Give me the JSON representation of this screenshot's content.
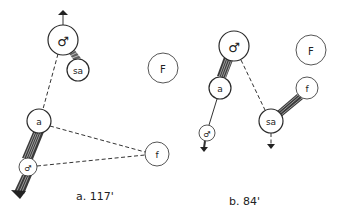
{
  "panels": [
    {
      "id": "a",
      "caption": "a. 117'",
      "nodes": {
        "male_large": {
          "label": "♂",
          "cx": 63,
          "cy": 40,
          "r": 15
        },
        "sa": {
          "label": "sa",
          "cx": 78,
          "cy": 70,
          "r": 11
        },
        "F": {
          "label": "F",
          "cx": 163,
          "cy": 68,
          "r": 15
        },
        "a": {
          "label": "a",
          "cx": 39,
          "cy": 121,
          "r": 12
        },
        "male_small": {
          "label": "♂",
          "cx": 28,
          "cy": 167,
          "r": 9
        },
        "f": {
          "label": "f",
          "cx": 157,
          "cy": 154,
          "r": 12
        }
      }
    },
    {
      "id": "b",
      "caption": "b. 84'",
      "nodes": {
        "male_large": {
          "label": "♂",
          "cx": 234,
          "cy": 46,
          "r": 15
        },
        "a": {
          "label": "a",
          "cx": 220,
          "cy": 88,
          "r": 11
        },
        "F": {
          "label": "F",
          "cx": 311,
          "cy": 50,
          "r": 15
        },
        "f": {
          "label": "f",
          "cx": 307,
          "cy": 88,
          "r": 11
        },
        "sa": {
          "label": "sa",
          "cx": 271,
          "cy": 121,
          "r": 12
        },
        "male_small": {
          "label": "♂",
          "cx": 207,
          "cy": 133,
          "r": 8
        }
      }
    }
  ],
  "colors": {
    "stroke": "#2a2a2a",
    "background": "#ffffff"
  }
}
